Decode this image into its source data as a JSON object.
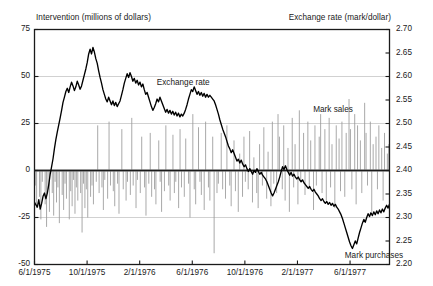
{
  "chart_data": {
    "type": "line",
    "title": "",
    "xlabel": "",
    "left_axis": {
      "label": "Intervention (millions of dollars)",
      "ticks": [
        75,
        50,
        25,
        0,
        -25,
        -50
      ],
      "tick_labels": [
        "75",
        "50",
        "25",
        "0",
        "-25",
        "-50"
      ],
      "ylim": [
        -50,
        75
      ]
    },
    "right_axis": {
      "label": "Exchange rate (mark/dollar)",
      "ticks": [
        2.7,
        2.65,
        2.6,
        2.55,
        2.5,
        2.45,
        2.4,
        2.35,
        2.3,
        2.25,
        2.2
      ],
      "tick_labels": [
        "2.70",
        "2.65",
        "2.60",
        "2.55",
        "2.50",
        "2.45",
        "2.40",
        "2.35",
        "2.30",
        "2.25",
        "2.20"
      ],
      "ylim": [
        2.2,
        2.7
      ]
    },
    "x_tick_labels": [
      "6/1/1975",
      "10/1/1975",
      "2/1/1976",
      "6/1/1976",
      "10/1/1976",
      "2/1/1977",
      "6/1/1977"
    ],
    "x_tick_positions": [
      0,
      4,
      8,
      12,
      16,
      20,
      24
    ],
    "x_range_months": [
      0,
      27
    ],
    "grid": "horizontal",
    "legend_position": "inline-annotations",
    "annotations": [
      {
        "text": "Exchange rate",
        "x_month": 9.3,
        "y_value": 2.585
      },
      {
        "text": "Mark sales",
        "x_month": 21.2,
        "y_value": 2.528
      },
      {
        "text": "Mark purchases",
        "x_month": 23.6,
        "y_value": 2.218
      }
    ],
    "colors": {
      "exchange_rate_line": "#000000",
      "intervention_bars": "#999999",
      "axis": "#1a1a1a",
      "gridline": "#cccccc",
      "background": "#ffffff"
    },
    "series": [
      {
        "name": "Exchange rate",
        "axis": "right",
        "units": "mark/dollar",
        "type": "line",
        "values": [
          2.332,
          2.327,
          2.322,
          2.338,
          2.318,
          2.33,
          2.345,
          2.352,
          2.34,
          2.352,
          2.37,
          2.392,
          2.408,
          2.425,
          2.447,
          2.466,
          2.482,
          2.497,
          2.512,
          2.528,
          2.545,
          2.556,
          2.568,
          2.575,
          2.566,
          2.578,
          2.588,
          2.58,
          2.57,
          2.578,
          2.59,
          2.582,
          2.573,
          2.58,
          2.592,
          2.604,
          2.616,
          2.63,
          2.648,
          2.658,
          2.648,
          2.662,
          2.652,
          2.638,
          2.628,
          2.612,
          2.598,
          2.586,
          2.572,
          2.562,
          2.552,
          2.546,
          2.556,
          2.548,
          2.54,
          2.548,
          2.538,
          2.545,
          2.536,
          2.542,
          2.548,
          2.56,
          2.572,
          2.586,
          2.596,
          2.606,
          2.598,
          2.608,
          2.6,
          2.59,
          2.596,
          2.586,
          2.592,
          2.582,
          2.588,
          2.578,
          2.584,
          2.572,
          2.562,
          2.566,
          2.556,
          2.546,
          2.536,
          2.528,
          2.534,
          2.542,
          2.552,
          2.546,
          2.556,
          2.548,
          2.54,
          2.532,
          2.524,
          2.53,
          2.522,
          2.528,
          2.52,
          2.526,
          2.518,
          2.524,
          2.516,
          2.522,
          2.514,
          2.52,
          2.516,
          2.522,
          2.53,
          2.54,
          2.552,
          2.562,
          2.572,
          2.568,
          2.578,
          2.57,
          2.562,
          2.568,
          2.56,
          2.566,
          2.558,
          2.564,
          2.556,
          2.562,
          2.556,
          2.56,
          2.556,
          2.552,
          2.548,
          2.54,
          2.53,
          2.52,
          2.508,
          2.498,
          2.488,
          2.48,
          2.472,
          2.462,
          2.452,
          2.446,
          2.438,
          2.444,
          2.436,
          2.428,
          2.42,
          2.424,
          2.416,
          2.422,
          2.414,
          2.408,
          2.412,
          2.404,
          2.398,
          2.404,
          2.398,
          2.392,
          2.4,
          2.396,
          2.404,
          2.398,
          2.392,
          2.396,
          2.39,
          2.386,
          2.382,
          2.376,
          2.368,
          2.36,
          2.352,
          2.346,
          2.352,
          2.36,
          2.368,
          2.376,
          2.386,
          2.398,
          2.408,
          2.402,
          2.41,
          2.402,
          2.396,
          2.39,
          2.396,
          2.388,
          2.392,
          2.386,
          2.382,
          2.386,
          2.38,
          2.376,
          2.38,
          2.374,
          2.37,
          2.366,
          2.362,
          2.366,
          2.36,
          2.356,
          2.36,
          2.354,
          2.35,
          2.346,
          2.34,
          2.336,
          2.34,
          2.334,
          2.33,
          2.334,
          2.328,
          2.332,
          2.326,
          2.33,
          2.324,
          2.328,
          2.322,
          2.318,
          2.312,
          2.306,
          2.298,
          2.288,
          2.278,
          2.268,
          2.258,
          2.248,
          2.24,
          2.234,
          2.242,
          2.25,
          2.244,
          2.256,
          2.268,
          2.278,
          2.288,
          2.296,
          2.29,
          2.3,
          2.308,
          2.302,
          2.31,
          2.304,
          2.312,
          2.306,
          2.314,
          2.308,
          2.316,
          2.31,
          2.318,
          2.312,
          2.32,
          2.326,
          2.32,
          2.328
        ]
      },
      {
        "name": "Intervention",
        "axis": "left",
        "units": "millions of dollars",
        "type": "bar",
        "note": "positive = Mark sales, negative = Mark purchases",
        "values": [
          -8,
          -20,
          0,
          -14,
          -26,
          -6,
          0,
          -18,
          -30,
          -10,
          -22,
          0,
          -12,
          -24,
          -6,
          -17,
          -9,
          -28,
          0,
          -13,
          -21,
          -7,
          -15,
          0,
          -26,
          -11,
          -19,
          -5,
          -23,
          -9,
          -16,
          0,
          -12,
          -33,
          -7,
          -20,
          -10,
          -25,
          0,
          -14,
          -8,
          -18,
          0,
          -6,
          24,
          -12,
          0,
          -9,
          -21,
          -5,
          0,
          -15,
          26,
          -8,
          0,
          -11,
          -19,
          0,
          -7,
          -23,
          0,
          22,
          -10,
          0,
          -16,
          -6,
          0,
          -13,
          28,
          -8,
          0,
          -20,
          -5,
          0,
          -12,
          18,
          0,
          -9,
          -24,
          0,
          -7,
          20,
          -14,
          0,
          -10,
          -18,
          0,
          16,
          -6,
          -22,
          0,
          -11,
          24,
          0,
          -8,
          -16,
          0,
          19,
          -12,
          -6,
          0,
          -20,
          22,
          -9,
          0,
          -14,
          17,
          0,
          -7,
          -25,
          0,
          30,
          -10,
          -18,
          0,
          23,
          -6,
          -13,
          0,
          -21,
          26,
          0,
          -9,
          -16,
          0,
          18,
          -44,
          0,
          -12,
          -7,
          0,
          20,
          -10,
          0,
          -15,
          24,
          0,
          -8,
          -19,
          0,
          16,
          -11,
          0,
          -22,
          9,
          0,
          -14,
          18,
          -6,
          0,
          -10,
          21,
          0,
          -17,
          7,
          0,
          -12,
          -20,
          14,
          0,
          -8,
          23,
          0,
          -15,
          10,
          0,
          -19,
          26,
          -7,
          0,
          -12,
          30,
          18,
          0,
          -10,
          24,
          -16,
          0,
          12,
          -22,
          0,
          28,
          -9,
          14,
          0,
          -18,
          32,
          -6,
          0,
          20,
          -13,
          0,
          26,
          -10,
          16,
          0,
          -21,
          24,
          -8,
          0,
          18,
          30,
          -12,
          0,
          22,
          -16,
          0,
          28,
          -9,
          14,
          0,
          -20,
          24,
          0,
          17,
          -11,
          26,
          0,
          -14,
          20,
          0,
          38,
          22,
          -10,
          0,
          30,
          -18,
          24,
          0,
          16,
          -12,
          0,
          36,
          20,
          -8,
          0,
          26,
          -22,
          14,
          0,
          18,
          -10,
          24,
          0,
          12,
          -16,
          20,
          0,
          9,
          14
        ]
      }
    ]
  }
}
